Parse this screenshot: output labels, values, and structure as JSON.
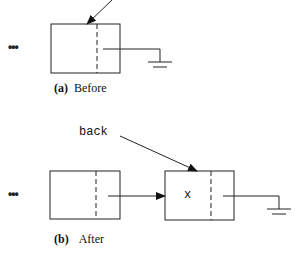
{
  "figure": {
    "before": {
      "caption_tag": "(a)",
      "caption_text": "Before",
      "ellipsis": "•••"
    },
    "after": {
      "caption_tag": "(b)",
      "caption_text": "After",
      "ellipsis": "•••",
      "pointer_label": "back",
      "new_node_value": "x"
    },
    "colors": {
      "stroke": "#222222",
      "background": "#ffffff"
    }
  }
}
